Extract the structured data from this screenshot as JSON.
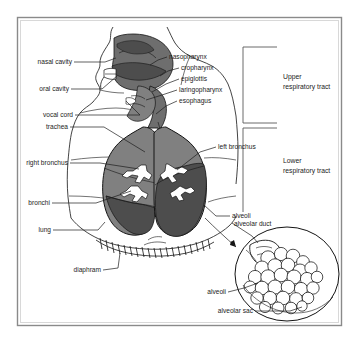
{
  "figure": {
    "background_color": "#ffffff",
    "frame_color": "#8a8a8a",
    "ink_color": "#141414",
    "lung_fill": "#808080",
    "lung_fill_dark": "#4d4d4d",
    "airway_fill": "#6e6e6e"
  },
  "labels": {
    "nasal_cavity": "nasal cavity",
    "oral_cavity": "oral cavity",
    "vocal_cord": "vocal cord",
    "trachea": "trachea",
    "right_bronchus": "right bronchus",
    "bronchi": "bronchi",
    "lung": "lung",
    "diaphram": "diaphram",
    "nasopharynx": "nasopharynx",
    "cropharynx": "cropharynx",
    "epiglottis": "epiglottis",
    "laringopharynx": "laringopharynx",
    "esophagus": "esophagus",
    "left_bronchus": "left bronchus",
    "alveoli_lung": "alveoli",
    "alveolar_duct": "alveolar duct",
    "alveoli_detail": "alveoli",
    "alveolar_sac": "alveolar sac"
  },
  "brackets": {
    "upper": {
      "line1": "Upper",
      "line2": "respiratory tract"
    },
    "lower": {
      "line1": "Lower",
      "line2": "respiratory tract"
    }
  }
}
